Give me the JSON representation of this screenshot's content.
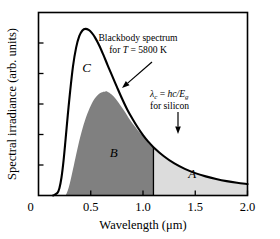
{
  "figure": {
    "name": "blackbody-spectrum-silicon-absorption",
    "background": "#ffffff"
  },
  "chart_data": {
    "type": "area",
    "title": "",
    "xlabel": "Wavelength (μm)",
    "ylabel": "Spectral irradiance (arb. units)",
    "xlim": [
      0,
      2.0
    ],
    "ylim": [
      0,
      1.12
    ],
    "xticks": [
      0.5,
      1.0,
      1.5,
      2.0
    ],
    "xticklabels": [
      "0.5",
      "1.0",
      "1.5",
      "2.0"
    ],
    "x_origin_label": "0",
    "y_origin_label": "0",
    "yticks_count": 5,
    "yticklabels": [],
    "grid": false,
    "legend": "none",
    "temperature_K": 5800,
    "cutoff_wavelength_um": 1.1,
    "series": [
      {
        "name": "blackbody-spectrum",
        "role": "outer-curve",
        "stroke": "#000000",
        "x": [
          0.14,
          0.18,
          0.2,
          0.22,
          0.24,
          0.26,
          0.28,
          0.3,
          0.33,
          0.36,
          0.39,
          0.42,
          0.45,
          0.48,
          0.51,
          0.54,
          0.58,
          0.62,
          0.66,
          0.7,
          0.75,
          0.8,
          0.85,
          0.9,
          0.95,
          1.0,
          1.05,
          1.1,
          1.2,
          1.3,
          1.4,
          1.5,
          1.6,
          1.7,
          1.8,
          1.9,
          2.0
        ],
        "y": [
          0.0,
          0.015,
          0.045,
          0.11,
          0.215,
          0.35,
          0.49,
          0.62,
          0.79,
          0.905,
          0.975,
          1.01,
          1.02,
          1.013,
          0.995,
          0.968,
          0.92,
          0.862,
          0.8,
          0.74,
          0.665,
          0.592,
          0.525,
          0.468,
          0.416,
          0.37,
          0.33,
          0.296,
          0.24,
          0.196,
          0.163,
          0.137,
          0.117,
          0.101,
          0.088,
          0.078,
          0.07
        ]
      },
      {
        "name": "absorbed-fraction-curve",
        "role": "inner-curve",
        "x": [
          0.26,
          0.28,
          0.3,
          0.33,
          0.36,
          0.4,
          0.44,
          0.48,
          0.52,
          0.56,
          0.6,
          0.64,
          0.66,
          0.7,
          0.74,
          0.78,
          0.82,
          0.86,
          0.9,
          0.95,
          1.0,
          1.05,
          1.1
        ],
        "y": [
          0.0,
          0.03,
          0.075,
          0.16,
          0.25,
          0.36,
          0.45,
          0.52,
          0.575,
          0.61,
          0.63,
          0.637,
          0.635,
          0.618,
          0.59,
          0.556,
          0.518,
          0.478,
          0.44,
          0.4,
          0.365,
          0.33,
          0.296
        ]
      }
    ],
    "regions": [
      {
        "label": "A",
        "name": "region-a-sub-bandgap-loss",
        "fill": "#dcdcdc",
        "label_x": 1.47,
        "label_y": 0.105,
        "description": "area under blackbody curve beyond cutoff wavelength"
      },
      {
        "label": "B",
        "name": "region-b-converted-energy",
        "fill": "#808080",
        "label_x": 0.72,
        "label_y": 0.235,
        "description": "area under inner curve below cutoff wavelength"
      },
      {
        "label": "C",
        "name": "region-c-thermalization-loss",
        "fill": "#ffffff",
        "label_x": 0.46,
        "label_y": 0.755,
        "description": "area between blackbody curve and inner curve"
      }
    ],
    "annotations": [
      {
        "name": "blackbody-annotation",
        "lines": [
          "Blackbody spectrum",
          "for T = 5800 K"
        ],
        "line1": "Blackbody spectrum",
        "line2_prefix": "for ",
        "line2_italic": "T",
        "line2_suffix": " = 5800 K",
        "text_x": 138,
        "text_y": 41,
        "arrow_from": [
          152,
          62
        ],
        "arrow_to": [
          122,
          88
        ]
      },
      {
        "name": "cutoff-annotation",
        "lines": [
          "λ_c = hc/E_g",
          "for silicon"
        ],
        "line1_lambda": "λ",
        "line1_lambda_sub": "c",
        "line1_eq": " = ",
        "line1_hc": "hc/E",
        "line1_e_sub": "g",
        "line2": "for silicon",
        "text_x": 176,
        "text_y": 97,
        "arrow_from": [
          178,
          112
        ],
        "arrow_to": [
          178,
          134
        ]
      }
    ]
  }
}
